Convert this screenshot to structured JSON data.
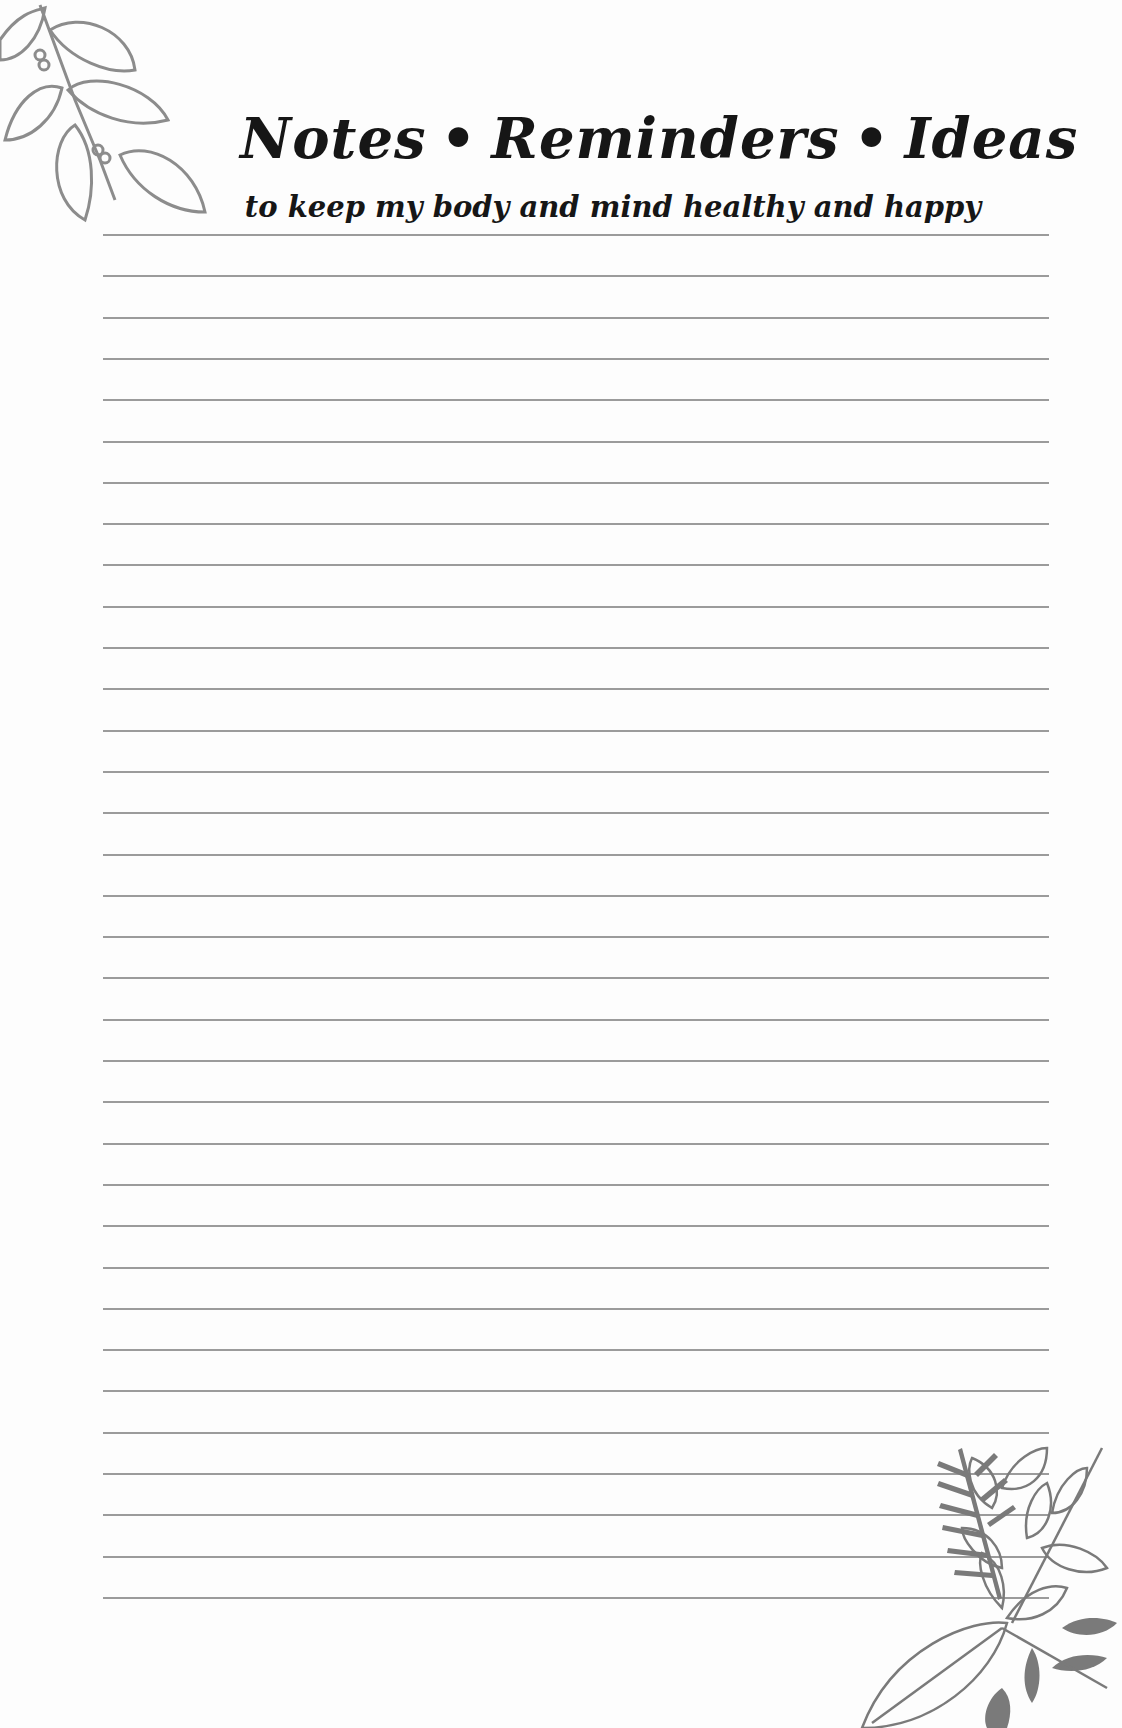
{
  "page": {
    "title_parts": [
      "Notes",
      "Reminders",
      "Ideas"
    ],
    "title_separator": "•",
    "subtitle": "to keep my body and mind healthy and happy",
    "ruled_lines": {
      "count": 34,
      "first_y": 0,
      "spacing": 41.3,
      "color": "#8a8a8a"
    },
    "decorations": [
      "leaf-sprig-top-left",
      "botanical-cluster-bottom-right"
    ]
  }
}
